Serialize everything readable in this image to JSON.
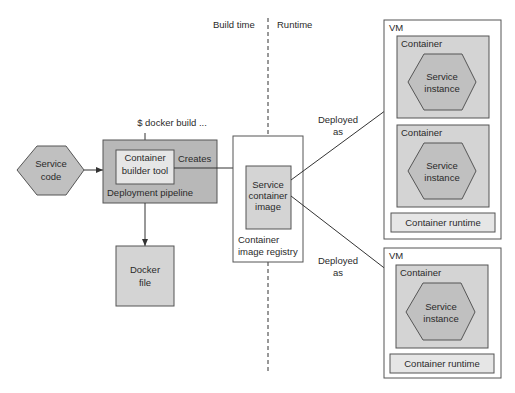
{
  "phases": {
    "build": "Build time",
    "runtime": "Runtime"
  },
  "command": "$ docker build ...",
  "service_code": {
    "line1": "Service",
    "line2": "code"
  },
  "pipeline": {
    "label": "Deployment pipeline",
    "builder": {
      "line1": "Container",
      "line2": "builder tool"
    },
    "creates": "Creates"
  },
  "docker_file": {
    "line1": "Docker",
    "line2": "file"
  },
  "registry": {
    "label_line1": "Container",
    "label_line2": "image registry",
    "image": {
      "line1": "Service",
      "line2": "container",
      "line3": "image"
    }
  },
  "deploy_labels": [
    {
      "line1": "Deployed",
      "line2": "as"
    },
    {
      "line1": "Deployed",
      "line2": "as"
    }
  ],
  "vms": [
    {
      "label": "VM",
      "containers": [
        {
          "label": "Container",
          "instance_line1": "Service",
          "instance_line2": "instance"
        },
        {
          "label": "Container",
          "instance_line1": "Service",
          "instance_line2": "instance"
        }
      ],
      "runtime": "Container runtime"
    },
    {
      "label": "VM",
      "containers": [
        {
          "label": "Container",
          "instance_line1": "Service",
          "instance_line2": "instance"
        }
      ],
      "runtime": "Container runtime"
    }
  ],
  "colors": {
    "pipeline_fill": "#b8b8b8",
    "container_fill": "#d4d4d4",
    "hexagon_fill": "#c0c0c0",
    "stroke": "#555555"
  }
}
